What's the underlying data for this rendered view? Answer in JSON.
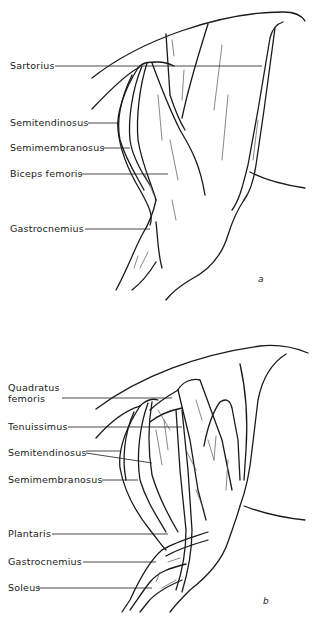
{
  "figures": [
    {
      "id": "a",
      "panel_label": "a",
      "labels": [
        {
          "text": "Sartorius"
        },
        {
          "text": "Semitendinosus"
        },
        {
          "text": "Semimembranosus"
        },
        {
          "text": "Biceps femoris"
        },
        {
          "text": "Gastrocnemius"
        }
      ]
    },
    {
      "id": "b",
      "panel_label": "b",
      "labels": [
        {
          "text": "Quadratus",
          "text2": "femoris"
        },
        {
          "text": "Tenuissimus"
        },
        {
          "text": "Semitendinosus"
        },
        {
          "text": "Semimembranosus"
        },
        {
          "text": "Plantaris"
        },
        {
          "text": "Gastrocnemius"
        },
        {
          "text": "Soleus"
        }
      ]
    }
  ]
}
